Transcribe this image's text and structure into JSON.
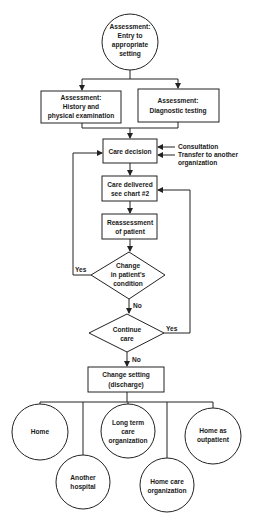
{
  "nodes": {
    "entry": {
      "lines": [
        "Assessment:",
        "Entry to",
        "appropriate",
        "setting"
      ],
      "shape": "circle"
    },
    "history": {
      "lines": [
        "Assessment:",
        "History and",
        "physical examination"
      ],
      "shape": "box"
    },
    "diagnostic": {
      "lines": [
        "Assessment:",
        "Diagnostic testing"
      ],
      "shape": "box"
    },
    "care_decision": {
      "lines": [
        "Care decision"
      ],
      "shape": "box"
    },
    "care_delivered": {
      "lines": [
        "Care delivered",
        "see chart #2"
      ],
      "shape": "box"
    },
    "reassessment": {
      "lines": [
        "Reassessment",
        "of patient"
      ],
      "shape": "box"
    },
    "change_condition": {
      "lines": [
        "Change",
        "in patient's",
        "condition"
      ],
      "shape": "diamond"
    },
    "continue_care": {
      "lines": [
        "Continue",
        "care"
      ],
      "shape": "diamond"
    },
    "change_setting": {
      "lines": [
        "Change setting",
        "(discharge)"
      ],
      "shape": "box"
    },
    "home": {
      "lines": [
        "Home"
      ],
      "shape": "circle"
    },
    "another_hospital": {
      "lines": [
        "Another",
        "hospital"
      ],
      "shape": "circle"
    },
    "long_term": {
      "lines": [
        "Long term",
        "care",
        "organization"
      ],
      "shape": "circle"
    },
    "home_care": {
      "lines": [
        "Home care",
        "organization"
      ],
      "shape": "circle"
    },
    "outpatient": {
      "lines": [
        "Home as",
        "outpatient"
      ],
      "shape": "circle"
    }
  },
  "side_inputs": {
    "consultation": "Consultation",
    "transfer": [
      "Transfer to another",
      "organization"
    ]
  },
  "edge_labels": {
    "condition_yes": "Yes",
    "condition_no": "No",
    "continue_yes": "Yes",
    "continue_no": "No"
  }
}
